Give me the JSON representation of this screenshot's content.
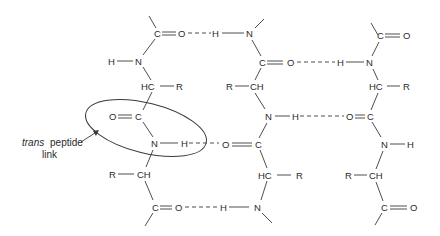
{
  "diagram": {
    "type": "chemical-structure",
    "annotation": {
      "line1_italic": "trans",
      "line1_rest": "peptide",
      "line2": "link"
    },
    "atoms": {
      "C": "C",
      "O": "O",
      "N": "N",
      "H": "H",
      "R": "R",
      "HC": "HC",
      "CH": "CH"
    },
    "chains": [
      {
        "name": "left-chain",
        "groups": [
          "C=O",
          "H-N",
          "HC-R",
          "O=C",
          "N-H",
          "R-CH",
          "C=O"
        ]
      },
      {
        "name": "middle-chain",
        "groups": [
          "N",
          "C=O",
          "R-CH",
          "N-H",
          "O=C",
          "HC-R",
          "H-N"
        ]
      },
      {
        "name": "right-chain",
        "groups": [
          "C=O",
          "H-N",
          "HC-R",
          "O=C",
          "N-H",
          "R-CH",
          "C=O"
        ]
      }
    ],
    "hydrogen_bonds": [
      "left C=O ··· H-N middle (top)",
      "middle C=O ··· H-N right",
      "left N-H ··· O=C middle",
      "middle N-H ··· O=C right",
      "left C=O ··· H-N middle (bottom)"
    ],
    "colors": {
      "line": "#3a3a3a",
      "text": "#2a2a2a",
      "background": "#ffffff"
    }
  }
}
